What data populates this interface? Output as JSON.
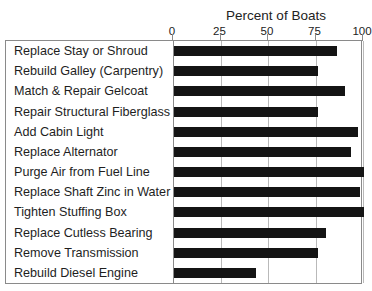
{
  "chart_data": {
    "type": "bar",
    "orientation": "horizontal",
    "title": "Percent of Boats",
    "xlabel": "Percent of Boats",
    "ylabel": "",
    "xlim": [
      0,
      100
    ],
    "xticks": [
      0,
      25,
      50,
      75,
      100
    ],
    "xtick_labels": [
      "0",
      "25",
      "50",
      "75",
      "100"
    ],
    "grid": true,
    "legend": null,
    "bar_color": "#141414",
    "frame_color": "#8a8a8a",
    "gridline_color": "#b9b9b9",
    "categories": [
      "Replace Stay or Shroud",
      "Rebuild Galley (Carpentry)",
      "Match & Repair Gelcoat",
      "Repair Structural Fiberglass",
      "Add Cabin Light",
      "Replace Alternator",
      "Purge Air from Fuel Line",
      "Replace Shaft Zinc in Water",
      "Tighten Stuffing Box",
      "Replace Cutless Bearing",
      "Remove Transmission",
      "Rebuild Diesel Engine"
    ],
    "values": [
      86,
      76,
      90,
      76,
      97,
      93,
      100,
      98,
      100,
      80,
      76,
      43
    ]
  }
}
